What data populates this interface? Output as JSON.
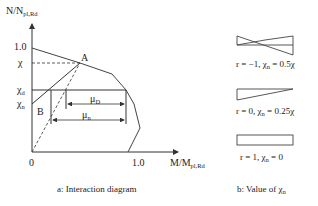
{
  "diagram_a": {
    "y_axis_label": "N/N",
    "y_axis_label_sub": "pl,Rd",
    "x_axis_label": "M/M",
    "x_axis_label_sub": "pl,Rd",
    "y_ticks": {
      "one": "1.0",
      "chi": "χ",
      "chi_d": "χ",
      "chi_d_sub": "d",
      "chi_n": "χ",
      "chi_n_sub": "n"
    },
    "x_ticks": {
      "zero": "0",
      "one": "1.0"
    },
    "points": {
      "A": "A",
      "B": "B"
    },
    "dimensions": {
      "mu_d": "μ",
      "mu_d_sub": "D",
      "mu_n": "μ",
      "mu_n_sub": "n"
    },
    "caption": "a: Interaction diagram"
  },
  "diagram_b": {
    "cases": [
      {
        "label": "r = −1, χ",
        "sub": "n",
        "value": " = 0.5χ"
      },
      {
        "label": "r = 0, χ",
        "sub": "n",
        "value": " = 0.25χ"
      },
      {
        "label": "r = 1, χ",
        "sub": "n",
        "value": " = 0"
      }
    ],
    "caption_prefix": "b: Value of χ",
    "caption_sub": "n"
  },
  "colors": {
    "line": "#333333",
    "background": "#ffffff"
  }
}
